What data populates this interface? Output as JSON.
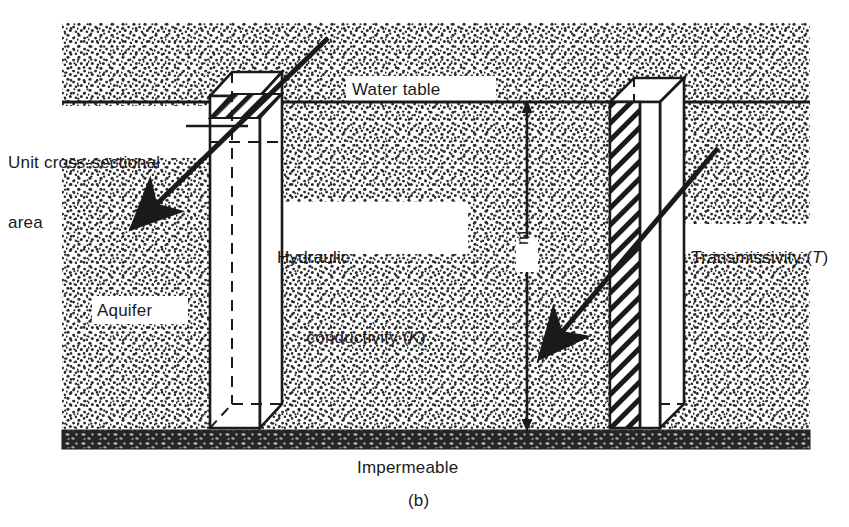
{
  "figure": {
    "caption": "(b)"
  },
  "labels": {
    "unit_area_line1": "Unit cross-sectional",
    "unit_area_line2": "area",
    "water_table": "Water table",
    "hydraulic_line1": "Hydraulic",
    "hydraulic_line2_text": "conductivity (",
    "hydraulic_symbol": "K",
    "hydraulic_line2_close": ")",
    "transmissivity_text": "Transmissivity (",
    "transmissivity_symbol": "T",
    "transmissivity_close": ")",
    "aquifer": "Aquifer",
    "impermeable": "Impermeable",
    "thickness": "m"
  },
  "colors": {
    "ink": "#1a1a1a",
    "background": "#ffffff",
    "stipple": "#2b2b2b",
    "impermeable_band": "#262626",
    "prism_fill": "#ffffff"
  },
  "elements": {
    "water_table_line": "horizontal water table line",
    "impermeable_layer": "dark impermeable bedrock band",
    "left_prism": "unit cross-sectional area prism",
    "right_prism": "full-thickness transmissivity prism",
    "flow_arrow_left": "groundwater flow direction arrow through unit area",
    "flow_arrow_right": "groundwater flow direction arrow through full thickness",
    "dimension_line": "aquifer saturated thickness dimension line"
  }
}
